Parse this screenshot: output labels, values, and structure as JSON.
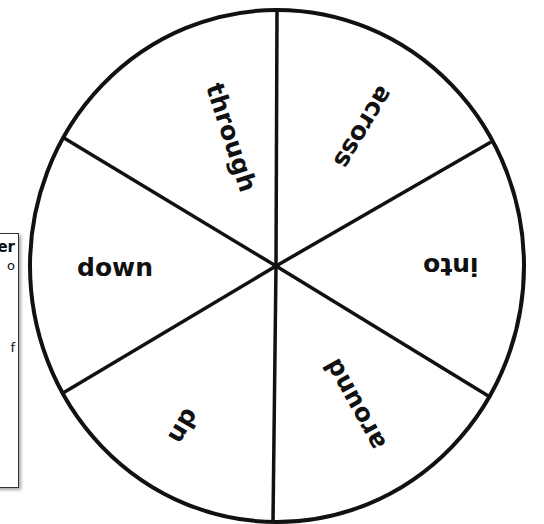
{
  "side_panel": {
    "fragments": {
      "title_tail": "er",
      "line1_tail": "o",
      "line2_tail": "f"
    }
  },
  "spinner": {
    "sections": [
      {
        "label": "through",
        "rotation_deg": 72
      },
      {
        "label": "across",
        "rotation_deg": 121
      },
      {
        "label": "into",
        "rotation_deg": 180
      },
      {
        "label": "around",
        "rotation_deg": 241
      },
      {
        "label": "up",
        "rotation_deg": 300
      },
      {
        "label": "down",
        "rotation_deg": 0
      }
    ],
    "stroke_color": "#111111",
    "fill_color": "#ffffff"
  }
}
